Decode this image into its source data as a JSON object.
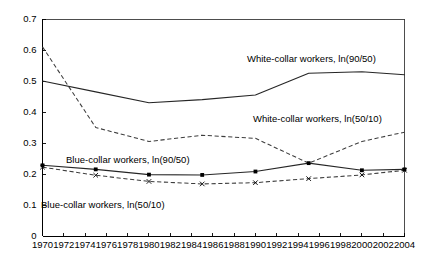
{
  "chart_data": {
    "type": "line",
    "title": "",
    "subtitle": "",
    "xlabel": "",
    "ylabel": "",
    "xlim": [
      1970,
      2004
    ],
    "ylim": [
      0,
      0.7
    ],
    "grid": false,
    "legend_position": "inline-annotations",
    "x_tick_labels": [
      "1970",
      "1972",
      "1974",
      "1976",
      "1978",
      "1980",
      "1982",
      "1984",
      "1986",
      "1988",
      "1990",
      "1992",
      "1994",
      "1996",
      "1998",
      "2000",
      "2002",
      "2004"
    ],
    "x_ticks": [
      1970,
      1972,
      1974,
      1976,
      1978,
      1980,
      1982,
      1984,
      1986,
      1988,
      1990,
      1992,
      1994,
      1996,
      1998,
      2000,
      2002,
      2004
    ],
    "y_tick_labels": [
      "0",
      "0.1",
      "0.2",
      "0.3",
      "0.4",
      "0.5",
      "0.6",
      "0.7"
    ],
    "y_ticks": [
      0,
      0.1,
      0.2,
      0.3,
      0.4,
      0.5,
      0.6,
      0.7
    ],
    "series": [
      {
        "name": "White-collar workers, ln(90/50)",
        "style": "solid",
        "markers": "none",
        "x": [
          1970,
          1975,
          1980,
          1985,
          1990,
          1995,
          2000,
          2004
        ],
        "values": [
          0.5,
          0.465,
          0.43,
          0.44,
          0.455,
          0.525,
          0.53,
          0.52
        ]
      },
      {
        "name": "White-collar workers, ln(50/10)",
        "style": "dashed",
        "markers": "none",
        "x": [
          1970,
          1975,
          1980,
          1985,
          1990,
          1995,
          2000,
          2004
        ],
        "values": [
          0.61,
          0.35,
          0.305,
          0.325,
          0.315,
          0.235,
          0.305,
          0.335
        ]
      },
      {
        "name": "Blue-collar workers, ln(90/50)",
        "style": "solid",
        "markers": "dot",
        "x": [
          1970,
          1975,
          1980,
          1985,
          1990,
          1995,
          2000,
          2004
        ],
        "values": [
          0.228,
          0.215,
          0.198,
          0.197,
          0.208,
          0.235,
          0.212,
          0.215
        ]
      },
      {
        "name": "Blue-collar workers, ln(50/10)",
        "style": "dashed",
        "markers": "cross",
        "x": [
          1970,
          1975,
          1980,
          1985,
          1990,
          1995,
          2000,
          2004
        ],
        "values": [
          0.222,
          0.196,
          0.176,
          0.168,
          0.172,
          0.185,
          0.197,
          0.212
        ]
      }
    ],
    "annotations": [
      {
        "text": "White-collar workers, ln(90/50)",
        "x_px": 247,
        "y_px": 62,
        "anchor": "start"
      },
      {
        "text": "White-collar workers, ln(50/10)",
        "x_px": 253,
        "y_px": 122,
        "anchor": "start"
      },
      {
        "text": "Blue-collar workers, ln(90/50)",
        "x_px": 66,
        "y_px": 163,
        "anchor": "start"
      },
      {
        "text": "Blue-collar workers, ln(50/10)",
        "x_px": 41,
        "y_px": 208,
        "anchor": "start"
      }
    ]
  }
}
